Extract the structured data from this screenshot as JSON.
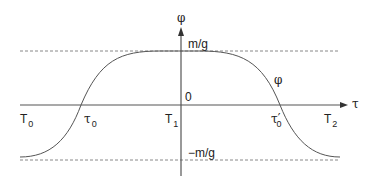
{
  "diagram": {
    "axes": {
      "vertical_label": "φ",
      "horizontal_label": "τ",
      "origin_label": "0"
    },
    "levels": {
      "upper": "m/g",
      "lower": "−m/g"
    },
    "curve_label": "φ",
    "points": {
      "T0": {
        "base": "T",
        "sub": "0"
      },
      "T1": {
        "base": "T",
        "sub": "1"
      },
      "T2": {
        "base": "T",
        "sub": "2"
      },
      "tau0": {
        "base": "τ",
        "sub": "0"
      },
      "tau0_prime": {
        "base": "τ′",
        "sub": "0"
      }
    },
    "colors": {
      "axis": "#444444",
      "curve": "#555555",
      "dashed": "#777777",
      "text": "#222222"
    }
  }
}
